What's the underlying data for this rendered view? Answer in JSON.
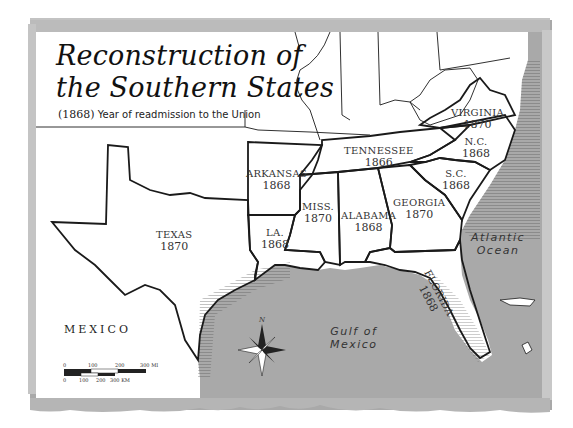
{
  "map": {
    "title_line1": "Reconstruction of",
    "title_line2": "the Southern States",
    "legend": {
      "sample_year": "(1868)",
      "description": "Year of readmission to the Union"
    },
    "states": [
      {
        "name": "Virginia",
        "year": "1870"
      },
      {
        "name": "N.C.",
        "year": "1868"
      },
      {
        "name": "Tennessee",
        "year": "1866"
      },
      {
        "name": "S.C.",
        "year": "1868"
      },
      {
        "name": "Arkansas",
        "year": "1868"
      },
      {
        "name": "Miss.",
        "year": "1870"
      },
      {
        "name": "Alabama",
        "year": "1868"
      },
      {
        "name": "Georgia",
        "year": "1870"
      },
      {
        "name": "La.",
        "year": "1868"
      },
      {
        "name": "Texas",
        "year": "1870"
      },
      {
        "name": "Florida",
        "year": "1868"
      }
    ],
    "water_bodies": {
      "atlantic_line1": "Atlantic",
      "atlantic_line2": "Ocean",
      "gulf_line1": "Gulf of",
      "gulf_line2": "Mexico"
    },
    "country_label": "MEXICO",
    "compass": {
      "north_label": "N"
    },
    "scale": {
      "miles_ticks": [
        "0",
        "100",
        "200",
        "300 MI"
      ],
      "km_ticks": [
        "0",
        "100",
        "200",
        "300 KM"
      ]
    },
    "colors": {
      "land": "#ffffff",
      "water": "#a6a6a6",
      "border": "#1a1a1a",
      "frame": "#bdbdbd"
    }
  }
}
